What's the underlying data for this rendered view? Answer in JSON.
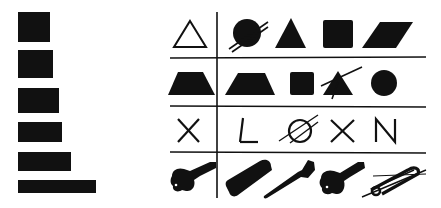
{
  "figure": {
    "colors": {
      "ink": "#111111",
      "background": "#ffffff"
    },
    "left_panel": {
      "description": "stack of bars increasing in width",
      "bars": [
        {
          "x": 18,
          "y": 12,
          "w": 32,
          "h": 30
        },
        {
          "x": 18,
          "y": 50,
          "w": 35,
          "h": 28
        },
        {
          "x": 18,
          "y": 88,
          "w": 41,
          "h": 25
        },
        {
          "x": 18,
          "y": 122,
          "w": 44,
          "h": 20
        },
        {
          "x": 18,
          "y": 152,
          "w": 53,
          "h": 19
        },
        {
          "x": 18,
          "y": 180,
          "w": 78,
          "h": 13
        }
      ]
    },
    "grid": {
      "rows": [
        {
          "sample": "outline-triangle-icon",
          "choices": [
            "slashed-circle-icon",
            "solid-triangle-icon",
            "solid-square-icon",
            "solid-parallelogram-icon"
          ]
        },
        {
          "sample": "solid-trapezoid-icon",
          "choices": [
            "solid-trapezoid-icon",
            "solid-square-icon",
            "slashed-triangle-icon",
            "solid-circle-icon"
          ]
        },
        {
          "sample": "X",
          "choices": [
            "L",
            "Ø",
            "X",
            "N"
          ]
        },
        {
          "sample": "key-icon",
          "choices": [
            "comb-icon",
            "toothbrush-icon",
            "key-icon",
            "slashed-safety-pin-icon"
          ]
        }
      ]
    }
  }
}
